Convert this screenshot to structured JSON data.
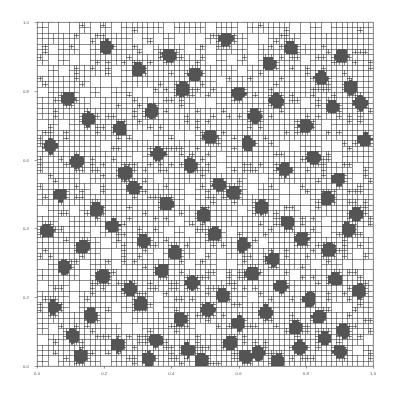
{
  "figure": {
    "kind": "quadtree-amr-grid-plot",
    "background_color": "#ffffff",
    "line_color": "#1c1c1c",
    "frame_color": "#4a4a4a",
    "tick_label_color": "#555a5e"
  },
  "chart_data": {
    "type": "scatter",
    "title": "",
    "subtitle": "",
    "xlabel": "",
    "ylabel": "",
    "xlim": [
      0.0,
      1.0
    ],
    "ylim": [
      0.0,
      1.0
    ],
    "grid": true,
    "legend": null,
    "legend_position": "none",
    "annotations": [],
    "xticks": [
      0.0,
      0.2,
      0.4,
      0.6,
      0.8,
      1.0
    ],
    "yticks": [
      0.0,
      0.2,
      0.4,
      0.6,
      0.8,
      1.0
    ],
    "xtick_labels": [
      "0.0",
      "0.2",
      "0.4",
      "0.6",
      "0.8",
      "1.0"
    ],
    "ytick_labels": [
      "0.0",
      "0.2",
      "0.4",
      "0.6",
      "0.8",
      "1.0"
    ],
    "max_depth": 9,
    "refinement_radius": 0.018,
    "series": [
      {
        "name": "refinement seeds",
        "x": [
          0.205,
          0.3,
          0.092,
          0.392,
          0.47,
          0.562,
          0.6,
          0.69,
          0.755,
          0.845,
          0.905,
          0.962,
          0.152,
          0.248,
          0.34,
          0.432,
          0.515,
          0.648,
          0.712,
          0.798,
          0.88,
          0.935,
          0.04,
          0.118,
          0.262,
          0.36,
          0.455,
          0.54,
          0.628,
          0.736,
          0.822,
          0.896,
          0.975,
          0.068,
          0.175,
          0.288,
          0.385,
          0.498,
          0.585,
          0.668,
          0.745,
          0.862,
          0.948,
          0.03,
          0.135,
          0.225,
          0.318,
          0.41,
          0.528,
          0.612,
          0.702,
          0.788,
          0.868,
          0.925,
          0.08,
          0.195,
          0.275,
          0.372,
          0.462,
          0.552,
          0.64,
          0.725,
          0.81,
          0.888,
          0.958,
          0.048,
          0.16,
          0.308,
          0.425,
          0.508,
          0.598,
          0.68,
          0.768,
          0.838,
          0.912,
          0.105,
          0.238,
          0.352,
          0.448,
          0.575,
          0.658,
          0.782,
          0.855,
          0.128,
          0.33,
          0.488,
          0.62,
          0.715,
          0.9
        ],
        "y": [
          0.928,
          0.862,
          0.78,
          0.905,
          0.848,
          0.952,
          0.795,
          0.88,
          0.925,
          0.838,
          0.902,
          0.765,
          0.718,
          0.69,
          0.742,
          0.805,
          0.668,
          0.728,
          0.772,
          0.7,
          0.755,
          0.812,
          0.64,
          0.595,
          0.562,
          0.618,
          0.585,
          0.528,
          0.648,
          0.572,
          0.605,
          0.545,
          0.658,
          0.498,
          0.455,
          0.52,
          0.472,
          0.438,
          0.505,
          0.462,
          0.418,
          0.488,
          0.442,
          0.392,
          0.348,
          0.408,
          0.365,
          0.33,
          0.385,
          0.352,
          0.312,
          0.372,
          0.338,
          0.398,
          0.288,
          0.262,
          0.225,
          0.278,
          0.242,
          0.205,
          0.268,
          0.232,
          0.195,
          0.252,
          0.218,
          0.172,
          0.148,
          0.182,
          0.138,
          0.165,
          0.125,
          0.158,
          0.112,
          0.145,
          0.102,
          0.088,
          0.062,
          0.075,
          0.048,
          0.068,
          0.038,
          0.055,
          0.082,
          0.03,
          0.022,
          0.018,
          0.028,
          0.015,
          0.042
        ]
      }
    ]
  }
}
